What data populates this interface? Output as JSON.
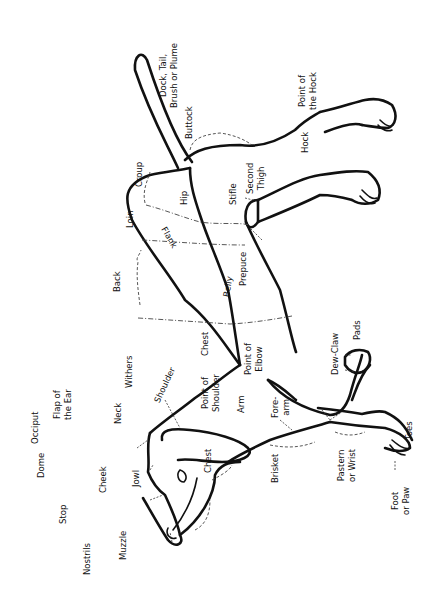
{
  "diagram": {
    "orientation": "rotated 90 degrees counter-clockwise (head at bottom-left, tail at top)",
    "labels": {
      "occiput": "Occiput",
      "dome": "Dome",
      "stop": "Stop",
      "nostrils": "Nostrils",
      "muzzle": "Muzzle",
      "cheek": "Cheek",
      "jowl": "Jowl",
      "flap_of_ear": "Flap of\nthe Ear",
      "neck": "Neck",
      "withers": "Withers",
      "shoulder": "Shoulder",
      "chest_front": "Chest",
      "point_of_shoulder": "Point of\nShoulder",
      "arm": "Arm",
      "forearm": "Fore-\narm",
      "brisket": "Brisket",
      "pastern": "Pastern\nor Wrist",
      "foot": "Foot\nor Paw",
      "toes": "Toes",
      "dew_claw": "Dew-Claw",
      "pads": "Pads",
      "chest": "Chest",
      "point_of_elbow": "Point of\nElbow",
      "back": "Back",
      "belly": "Belly",
      "loin": "Loin",
      "flank": "Flank",
      "prepuce": "Prepuce",
      "croup": "Croup",
      "hip": "Hip",
      "stifle": "Stifle",
      "second_thigh": "Second\nThigh",
      "buttock": "Buttock",
      "tail": "Dock, Tail,\nBrush or Plume",
      "hock": "Hock",
      "point_of_hock": "Point of\nthe Hock"
    },
    "colors": {
      "line": "#111111",
      "background": "#ffffff"
    }
  }
}
